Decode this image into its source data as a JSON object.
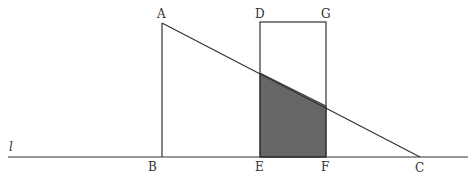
{
  "diagram": {
    "line_label": "l",
    "points": {
      "A": {
        "label": "A",
        "x": 162,
        "y": 23
      },
      "B": {
        "label": "B",
        "x": 162,
        "y": 157
      },
      "C": {
        "label": "C",
        "x": 420,
        "y": 157
      },
      "D": {
        "label": "D",
        "x": 260,
        "y": 22
      },
      "E": {
        "label": "E",
        "x": 260,
        "y": 157
      },
      "F": {
        "label": "F",
        "x": 326,
        "y": 157
      },
      "G": {
        "label": "G",
        "x": 326,
        "y": 22
      }
    },
    "colors": {
      "stroke": "#333333",
      "shade": "#666666",
      "background": "#ffffff"
    }
  }
}
